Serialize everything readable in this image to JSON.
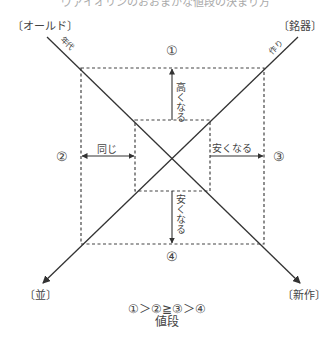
{
  "header": {
    "cutoff_title": "ヴァイオリンのおおまかな値段の決まり方"
  },
  "corners": {
    "top_left": "〔オールド〕",
    "top_right": "〔銘器〕",
    "bottom_left": "〔並〕",
    "bottom_right": "〔新作〕"
  },
  "axes": {
    "diag_top_left_label": "年代",
    "diag_top_right_label": "作り"
  },
  "regions": {
    "r1": "①",
    "r2": "②",
    "r3": "③",
    "r4": "④"
  },
  "arrows": {
    "up": "高くなる",
    "left": "同じ",
    "right": "安くなる",
    "down": "安くなる"
  },
  "caption": {
    "order": "①＞②≧③＞④",
    "subject": "値段"
  },
  "colors": {
    "line": "#333333",
    "dash": "#444444",
    "text": "#444444"
  }
}
